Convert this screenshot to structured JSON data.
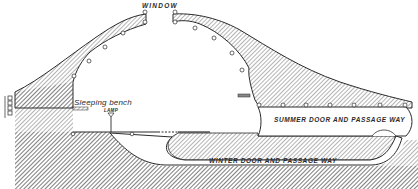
{
  "diagram": {
    "type": "cross-section",
    "labels": {
      "window": "WINDOW",
      "sleeping_bench": "Sleeping bench",
      "lamp": "LAMP",
      "summer_passage": "SUMMER DOOR AND PASSAGE WAY",
      "winter_passage": "WINTER DOOR AND PASSAGE WAY"
    },
    "colors": {
      "ink": "#2a2a2a",
      "background": "#ffffff"
    }
  }
}
